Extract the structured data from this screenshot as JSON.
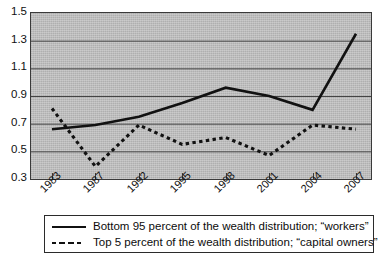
{
  "chart_data": {
    "type": "line",
    "title": "",
    "subtitle": "",
    "xlabel": "",
    "ylabel": "",
    "categories": [
      "1983",
      "1987",
      "1992",
      "1995",
      "1998",
      "2001",
      "2004",
      "2007"
    ],
    "x_tick_labels": [
      "1983",
      "1987",
      "1992",
      "1995",
      "1998",
      "2001",
      "2004",
      "2007"
    ],
    "y_tick_labels": [
      "1.5",
      "1.3",
      "1.1",
      "0.9",
      "0.7",
      "0.5",
      "0.3"
    ],
    "y_tick_values": [
      1.5,
      1.3,
      1.1,
      0.9,
      0.7,
      0.5,
      0.3
    ],
    "ylim": [
      0.3,
      1.5
    ],
    "grid": "horizontal",
    "legend_position": "below-axes",
    "plot_background": "#b8b8b8",
    "line_color": "#111111",
    "series": [
      {
        "name": "Bottom 95 percent of the wealth distribution; “workers”",
        "style": "solid",
        "values": [
          0.66,
          0.69,
          0.75,
          0.85,
          0.96,
          0.9,
          0.8,
          1.35
        ]
      },
      {
        "name": "Top 5 percent of the wealth distribution; “capital owners”",
        "style": "dashed",
        "values": [
          0.81,
          0.39,
          0.69,
          0.55,
          0.6,
          0.47,
          0.69,
          0.66
        ]
      }
    ]
  },
  "legend": {
    "entries": [
      {
        "label": "Bottom 95 percent of the wealth distribution; “workers”",
        "style": "solid"
      },
      {
        "label": "Top 5 percent of the wealth distribution; “capital owners”",
        "style": "dashed"
      }
    ]
  }
}
